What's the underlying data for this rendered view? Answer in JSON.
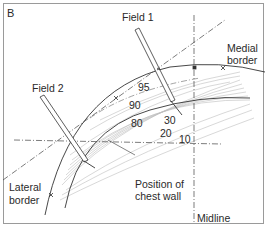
{
  "panel_label": "B",
  "labels": {
    "field1": "Field 1",
    "field2": "Field 2",
    "medial_border_line1": "Medial",
    "medial_border_line2": "border",
    "lateral_border_line1": "Lateral",
    "lateral_border_line2": "border",
    "chest_wall_line1": "Position of",
    "chest_wall_line2": "chest wall",
    "midline": "Midline"
  },
  "isodose_values": [
    "95",
    "90",
    "80",
    "30",
    "20",
    "10"
  ],
  "colors": {
    "line": "#333333",
    "hatch": "#b5b5b5",
    "frame": "#9a9a9a"
  }
}
